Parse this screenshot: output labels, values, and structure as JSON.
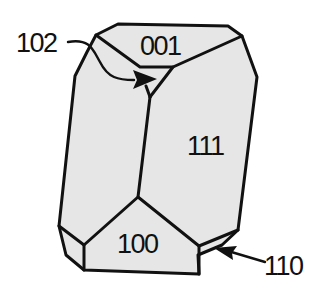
{
  "diagram": {
    "type": "crystal-habit",
    "face_color": "#e6e6e6",
    "line_color": "#111111",
    "faces": [
      {
        "id": "face-001",
        "label": "001"
      },
      {
        "id": "face-111",
        "label": "111"
      },
      {
        "id": "face-100",
        "label": "100"
      }
    ],
    "callouts": [
      {
        "id": "callout-102",
        "label": "102"
      },
      {
        "id": "callout-110",
        "label": "110"
      }
    ]
  }
}
